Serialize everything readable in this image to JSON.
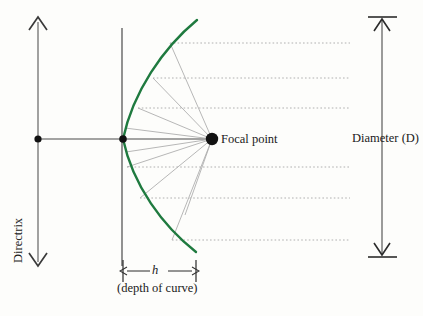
{
  "figure": {
    "labels": {
      "focal_point": "Focal point",
      "diameter": "Diameter (D)",
      "depth_symbol": "h",
      "depth_caption": "(depth of curve)",
      "directrix": "Directrix"
    },
    "colors": {
      "curve": "#1f7a3f",
      "axis": "#4d4d4d",
      "ray": "#9a9a9a",
      "dot": "#111111",
      "text": "#1a1a1a",
      "background": "#fdfdfb"
    },
    "geometry": {
      "directrix_line": {
        "x": 38,
        "y_top": 18,
        "y_bottom": 266
      },
      "axis_of_symmetry": {
        "y": 139,
        "x_left": 38,
        "x_right": 212
      },
      "vertex_line": {
        "x": 122,
        "y_top": 28,
        "y_bottom": 266
      },
      "vertex_point": {
        "x": 123,
        "y": 139
      },
      "focal_point": {
        "x": 212,
        "y": 139
      },
      "directrix_point": {
        "x": 38,
        "y": 139
      },
      "parabola": {
        "vertex_x": 123,
        "focal_x": 212,
        "y_top_end": 20,
        "y_bottom_end": 252
      },
      "diameter_bar": {
        "x": 382,
        "y_top": 17,
        "y_bottom": 257
      },
      "depth_bar": {
        "x_left": 123,
        "x_right": 196,
        "y": 271
      },
      "ray_right_end": 350,
      "ray_y_values": [
        43,
        78,
        108,
        167,
        198,
        240
      ]
    }
  }
}
